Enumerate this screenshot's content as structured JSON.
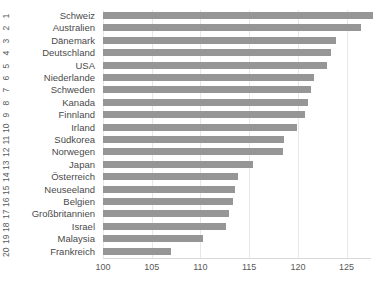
{
  "chart_data": {
    "type": "bar",
    "orientation": "horizontal",
    "title": "",
    "xlabel": "",
    "ylabel": "",
    "xlim": [
      100,
      127.5
    ],
    "xticks": [
      100,
      105,
      110,
      115,
      120,
      125
    ],
    "grid": true,
    "legend": false,
    "bar_color": "#969696",
    "categories": [
      "Schweiz",
      "Australien",
      "Dänemark",
      "Deutschland",
      "USA",
      "Niederlande",
      "Schweden",
      "Kanada",
      "Finnland",
      "Irland",
      "Südkorea",
      "Norwegen",
      "Japan",
      "Österreich",
      "Neuseeland",
      "Belgien",
      "Großbritannien",
      "Israel",
      "Malaysia",
      "Frankreich"
    ],
    "ranks": [
      1,
      2,
      3,
      4,
      5,
      6,
      7,
      8,
      9,
      10,
      11,
      12,
      13,
      14,
      15,
      16,
      17,
      18,
      19,
      20
    ],
    "values": [
      127.7,
      126.5,
      123.9,
      123.4,
      123.0,
      121.6,
      121.3,
      121.0,
      120.7,
      119.9,
      118.6,
      118.5,
      115.4,
      113.9,
      113.5,
      113.3,
      112.9,
      112.6,
      110.3,
      107.0
    ]
  }
}
